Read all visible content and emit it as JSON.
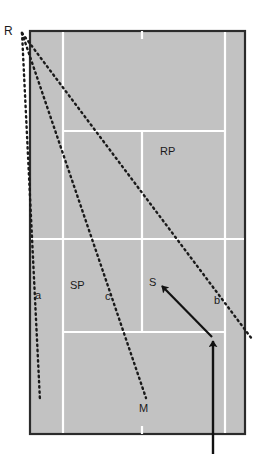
{
  "diagram": {
    "type": "tennis-court-tactical-diagram",
    "court": {
      "surface_color": "#c2c2c2",
      "border_color": "#2b2b2b",
      "line_color": "#ffffff",
      "bounds": {
        "x": 30,
        "y": 31,
        "width": 215,
        "height": 403
      },
      "lines": {
        "singles_sideline_left_x": 63,
        "singles_sideline_right_x": 225,
        "center_service_line_x": 142,
        "service_line_top_y": 131,
        "net_y": 239,
        "service_line_bottom_y": 332
      }
    },
    "origin_point": {
      "name": "R",
      "x": 22,
      "y": 33
    },
    "dotted_lines": [
      {
        "id": "a",
        "label": "a",
        "from_x": 22,
        "from_y": 33,
        "to_x": 40,
        "to_y": 401,
        "label_x": 35,
        "label_y": 299
      },
      {
        "id": "c",
        "label": "c",
        "from_x": 22,
        "from_y": 33,
        "to_x": 146,
        "to_y": 398,
        "label_x": 105,
        "label_y": 300
      },
      {
        "id": "b",
        "label": "b",
        "from_x": 22,
        "from_y": 33,
        "to_x": 252,
        "to_y": 339,
        "label_x": 214,
        "label_y": 304
      }
    ],
    "arrows": [
      {
        "id": "approach",
        "from_x": 213,
        "from_y": 454,
        "to_x": 213,
        "to_y": 339,
        "color": "#111111"
      },
      {
        "id": "shot-to-S",
        "from_x": 212,
        "from_y": 337,
        "to_x": 160,
        "to_y": 284,
        "color": "#111111"
      }
    ],
    "labels": [
      {
        "id": "R",
        "text": "R",
        "x": 4,
        "y": 35,
        "size": 12
      },
      {
        "id": "a",
        "text": "a",
        "x": 35,
        "y": 299,
        "size": 11
      },
      {
        "id": "SP",
        "text": "SP",
        "x": 70,
        "y": 289,
        "size": 11
      },
      {
        "id": "c",
        "text": "c",
        "x": 105,
        "y": 300,
        "size": 11
      },
      {
        "id": "b",
        "text": "b",
        "x": 214,
        "y": 304,
        "size": 11
      },
      {
        "id": "S",
        "text": "S",
        "x": 149,
        "y": 286,
        "size": 11
      },
      {
        "id": "RP",
        "text": "RP",
        "x": 160,
        "y": 155,
        "size": 11
      },
      {
        "id": "M",
        "text": "M",
        "x": 139,
        "y": 412,
        "size": 11
      }
    ]
  }
}
